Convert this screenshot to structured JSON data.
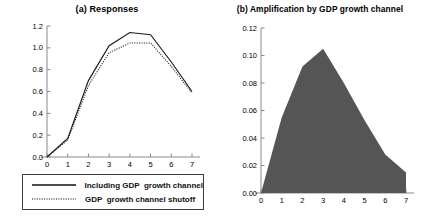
{
  "figure": {
    "background": "#ffffff",
    "panels": [
      {
        "id": "a",
        "title": "(a) Responses"
      },
      {
        "id": "b",
        "title": "(b) Amplification by GDP growth channel"
      }
    ]
  },
  "legend": {
    "position": "below-panel-a",
    "entries": [
      {
        "key": "solid-line",
        "label": "Including GDP  growth channel"
      },
      {
        "key": "dotted-line",
        "label": "GDP  growth channel shutoff"
      }
    ]
  },
  "chart_data": [
    {
      "type": "line",
      "title": "(a) Responses",
      "xlabel": "",
      "ylabel": "",
      "x": [
        0,
        1,
        2,
        3,
        4,
        5,
        6,
        7
      ],
      "xlim": [
        0,
        7
      ],
      "ylim": [
        0.0,
        1.2
      ],
      "xticks": [
        "0",
        "1",
        "2",
        "3",
        "4",
        "5",
        "6",
        "7"
      ],
      "yticks": [
        "0.0",
        "0.2",
        "0.4",
        "0.6",
        "0.8",
        "1.0",
        "1.2"
      ],
      "grid": false,
      "legend_position": "below",
      "series": [
        {
          "name": "Including GDP  growth channel",
          "style": "solid",
          "color": "#1a1a1a",
          "values": [
            0.0,
            0.17,
            0.7,
            1.02,
            1.14,
            1.12,
            0.87,
            0.6
          ]
        },
        {
          "name": "GDP  growth channel shutoff",
          "style": "dotted",
          "color": "#1a1a1a",
          "values": [
            0.0,
            0.155,
            0.655,
            0.955,
            1.045,
            1.045,
            0.83,
            0.585
          ]
        }
      ]
    },
    {
      "type": "area",
      "title": "(b) Amplification by GDP growth channel",
      "xlabel": "",
      "ylabel": "",
      "x": [
        0,
        1,
        2,
        3,
        4,
        5,
        6,
        7
      ],
      "xlim": [
        0,
        7
      ],
      "ylim": [
        0.0,
        0.12
      ],
      "xticks": [
        "0",
        "1",
        "2",
        "3",
        "4",
        "5",
        "6",
        "7"
      ],
      "yticks": [
        "0.00",
        "0.02",
        "0.04",
        "0.06",
        "0.08",
        "0.10",
        "0.12"
      ],
      "grid": false,
      "fill_color": "#555555",
      "series": [
        {
          "name": "Amplification",
          "style": "filled-area",
          "color": "#555555",
          "values": [
            0.0,
            0.055,
            0.092,
            0.105,
            0.08,
            0.053,
            0.028,
            0.015
          ]
        }
      ]
    }
  ]
}
